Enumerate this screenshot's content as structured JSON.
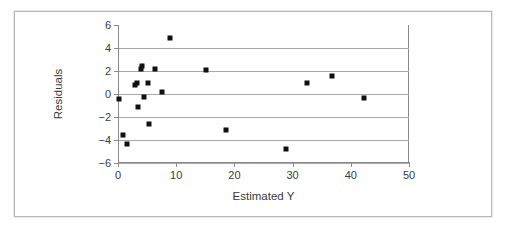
{
  "chart_data": {
    "type": "scatter",
    "title": "",
    "xlabel": "Estimated Y",
    "ylabel": "Residuals",
    "xlim": [
      0,
      50
    ],
    "ylim": [
      -6,
      6
    ],
    "xticks": [
      0,
      10,
      20,
      30,
      40,
      50
    ],
    "yticks": [
      -6,
      -4,
      -2,
      0,
      2,
      4,
      6
    ],
    "xtick_labels": [
      "0",
      "10",
      "20",
      "30",
      "40",
      "50"
    ],
    "ytick_labels": [
      "−6",
      "−4",
      "−2",
      "0",
      "2",
      "4",
      "6"
    ],
    "grid": "horizontal",
    "legend": null,
    "marker": "square",
    "marker_color": "#111111",
    "points": [
      {
        "x": 0.2,
        "y": -0.4
      },
      {
        "x": 0.9,
        "y": -3.6
      },
      {
        "x": 1.6,
        "y": -4.35
      },
      {
        "x": 3.0,
        "y": 0.75
      },
      {
        "x": 3.2,
        "y": 0.95
      },
      {
        "x": 3.4,
        "y": -1.1
      },
      {
        "x": 3.9,
        "y": 2.15
      },
      {
        "x": 4.1,
        "y": 2.45
      },
      {
        "x": 4.5,
        "y": -0.25
      },
      {
        "x": 5.1,
        "y": 0.95
      },
      {
        "x": 5.3,
        "y": -2.6
      },
      {
        "x": 6.3,
        "y": 2.2
      },
      {
        "x": 7.5,
        "y": 0.15
      },
      {
        "x": 9.0,
        "y": 4.9
      },
      {
        "x": 15.2,
        "y": 2.1
      },
      {
        "x": 18.6,
        "y": -3.1
      },
      {
        "x": 28.9,
        "y": -4.75
      },
      {
        "x": 32.4,
        "y": 0.95
      },
      {
        "x": 36.7,
        "y": 1.6
      },
      {
        "x": 42.2,
        "y": -0.35
      }
    ]
  },
  "colors": {
    "frame_border": "#b8b8b8",
    "gridline": "#a9a9a9",
    "axis": "#8a8a8a",
    "text": "#3a3a3a",
    "background": "#ffffff"
  }
}
